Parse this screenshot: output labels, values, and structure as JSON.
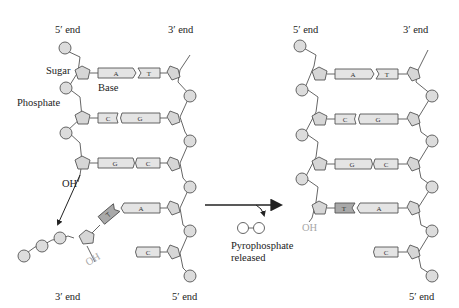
{
  "figure": {
    "colors": {
      "circle_fill": "#dcdcdc",
      "pentagon_fill": "#d6d6d6",
      "base_fill": "#e4e4e4",
      "incoming_base_fill": "#a9a9a9",
      "stroke": "#555555",
      "text": "#222222",
      "oh_released": "#a8a8a8"
    }
  },
  "left_panel": {
    "top_left_label": "5′ end",
    "top_right_label": "3′ end",
    "bottom_left_label": "3′ end",
    "bottom_right_label": "5′ end",
    "sugar_label": "Sugar",
    "base_label": "Base",
    "phosphate_label": "Phosphate",
    "oh_label": "OH",
    "incoming_oh_label": "OH",
    "pairs": [
      {
        "left": "A",
        "right": "T"
      },
      {
        "left": "C",
        "right": "G"
      },
      {
        "left": "G",
        "right": "C"
      },
      {
        "left": "",
        "right": "A"
      },
      {
        "left": "",
        "right": "C"
      }
    ],
    "incoming_base": "T"
  },
  "middle": {
    "pyrophosphate_line1": "Pyrophosphate",
    "pyrophosphate_line2": "released"
  },
  "right_panel": {
    "top_left_label": "5′ end",
    "top_right_label": "3′ end",
    "bottom_right_label": "5′ end",
    "oh_label": "OH",
    "pairs": [
      {
        "left": "A",
        "right": "T"
      },
      {
        "left": "C",
        "right": "G"
      },
      {
        "left": "G",
        "right": "C"
      },
      {
        "left": "T",
        "right": "A"
      },
      {
        "left": "",
        "right": "C"
      }
    ]
  }
}
